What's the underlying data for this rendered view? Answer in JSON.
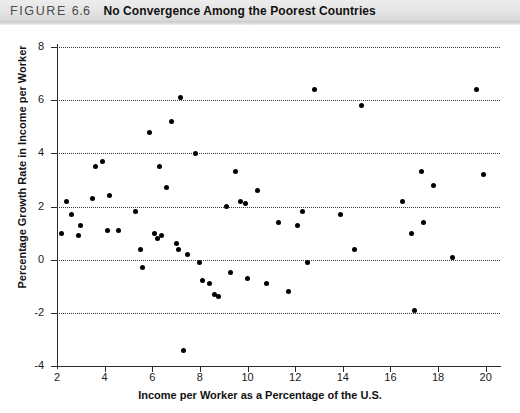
{
  "header": {
    "figure_label": "FIGURE",
    "figure_number": "6.6",
    "title": "No Convergence Among the Poorest Countries"
  },
  "chart_data": {
    "type": "scatter",
    "title": "No Convergence Among the Poorest Countries",
    "xlabel": "Income per Worker as a Percentage of the U.S.",
    "ylabel": "Percentage Growth Rate in Income per Worker",
    "xlim": [
      2,
      20.6
    ],
    "ylim": [
      -4,
      8
    ],
    "xticks": [
      2,
      4,
      6,
      8,
      10,
      12,
      14,
      16,
      18,
      20
    ],
    "xticklabels": [
      "2",
      "4",
      "6",
      "8",
      "10",
      "12",
      "14",
      "16",
      "18",
      "20"
    ],
    "yticks": [
      -4,
      -2,
      0,
      2,
      4,
      6,
      8
    ],
    "yticklabels": [
      "-4",
      "-2",
      "0",
      "2",
      "4",
      "6",
      "8"
    ],
    "grid": "horizontal-dotted",
    "legend": "none",
    "marker": "filled-circle",
    "marker_color": "#000000",
    "points": [
      {
        "x": 2.2,
        "y": 1.0
      },
      {
        "x": 2.4,
        "y": 2.2
      },
      {
        "x": 2.6,
        "y": 1.7
      },
      {
        "x": 2.9,
        "y": 0.9
      },
      {
        "x": 3.0,
        "y": 1.3
      },
      {
        "x": 3.5,
        "y": 2.3
      },
      {
        "x": 3.6,
        "y": 3.5
      },
      {
        "x": 3.9,
        "y": 3.7
      },
      {
        "x": 4.1,
        "y": 1.1
      },
      {
        "x": 4.2,
        "y": 2.4
      },
      {
        "x": 4.6,
        "y": 1.1
      },
      {
        "x": 5.3,
        "y": 1.8
      },
      {
        "x": 5.5,
        "y": 0.4
      },
      {
        "x": 5.6,
        "y": -0.3
      },
      {
        "x": 5.9,
        "y": 4.8
      },
      {
        "x": 6.1,
        "y": 1.0
      },
      {
        "x": 6.2,
        "y": 0.8
      },
      {
        "x": 6.3,
        "y": 3.5
      },
      {
        "x": 6.4,
        "y": 0.9
      },
      {
        "x": 6.6,
        "y": 2.7
      },
      {
        "x": 6.8,
        "y": 5.2
      },
      {
        "x": 7.0,
        "y": 0.6
      },
      {
        "x": 7.1,
        "y": 0.4
      },
      {
        "x": 7.2,
        "y": 6.1
      },
      {
        "x": 7.3,
        "y": -3.4
      },
      {
        "x": 7.5,
        "y": 0.2
      },
      {
        "x": 7.8,
        "y": 4.0
      },
      {
        "x": 8.0,
        "y": -0.1
      },
      {
        "x": 8.1,
        "y": -0.8
      },
      {
        "x": 8.4,
        "y": -0.9
      },
      {
        "x": 8.6,
        "y": -1.3
      },
      {
        "x": 8.8,
        "y": -1.4
      },
      {
        "x": 9.1,
        "y": 2.0
      },
      {
        "x": 9.3,
        "y": -0.5
      },
      {
        "x": 9.5,
        "y": 3.3
      },
      {
        "x": 9.7,
        "y": 2.2
      },
      {
        "x": 9.9,
        "y": 2.1
      },
      {
        "x": 10.0,
        "y": -0.7
      },
      {
        "x": 10.4,
        "y": 2.6
      },
      {
        "x": 10.8,
        "y": -0.9
      },
      {
        "x": 11.3,
        "y": 1.4
      },
      {
        "x": 11.7,
        "y": -1.2
      },
      {
        "x": 12.1,
        "y": 1.3
      },
      {
        "x": 12.3,
        "y": 1.8
      },
      {
        "x": 12.5,
        "y": -0.1
      },
      {
        "x": 12.8,
        "y": 6.4
      },
      {
        "x": 13.9,
        "y": 1.7
      },
      {
        "x": 14.5,
        "y": 0.4
      },
      {
        "x": 14.8,
        "y": 5.8
      },
      {
        "x": 16.5,
        "y": 2.2
      },
      {
        "x": 16.9,
        "y": 1.0
      },
      {
        "x": 17.0,
        "y": -1.9
      },
      {
        "x": 17.3,
        "y": 3.3
      },
      {
        "x": 17.4,
        "y": 1.4
      },
      {
        "x": 17.8,
        "y": 2.8
      },
      {
        "x": 18.6,
        "y": 0.1
      },
      {
        "x": 19.6,
        "y": 6.4
      },
      {
        "x": 19.9,
        "y": 3.2
      }
    ]
  }
}
